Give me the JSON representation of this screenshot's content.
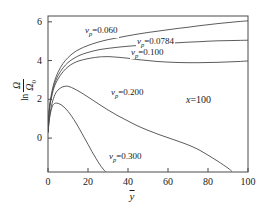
{
  "chart_data": {
    "type": "line",
    "title": "",
    "xlabel": "ȳ",
    "ylabel": "ln Ω/Ω₀",
    "xlim": [
      0,
      100
    ],
    "ylim": [
      -1.75,
      6.3
    ],
    "grid": false,
    "legend_position": "inline-annotations",
    "xticks": [
      "0",
      "20",
      "40",
      "60",
      "80",
      "100"
    ],
    "xtick_values": [
      0,
      20,
      40,
      60,
      80,
      100
    ],
    "yticks": [
      "0",
      "2",
      "4",
      "6"
    ],
    "ytick_values": [
      0,
      2,
      4,
      6
    ],
    "annotations": [
      {
        "text": "x=100",
        "x": 64,
        "y": 3.0
      }
    ],
    "series": [
      {
        "name": "v_p=0.060",
        "label": "v",
        "label_sub": "p",
        "label_value": "=0.060",
        "label_x": 18,
        "label_y": 5.45,
        "x": [
          0,
          0.6,
          1.5,
          3,
          5,
          7.5,
          10,
          13,
          16,
          20,
          25,
          30,
          35,
          40,
          45,
          50,
          55,
          60,
          65,
          70,
          75,
          80,
          85,
          90,
          95,
          100
        ],
        "y": [
          0.3,
          1.45,
          2.15,
          2.85,
          3.4,
          3.85,
          4.15,
          4.42,
          4.6,
          4.78,
          4.95,
          5.08,
          5.18,
          5.28,
          5.37,
          5.45,
          5.52,
          5.59,
          5.66,
          5.72,
          5.79,
          5.85,
          5.91,
          5.96,
          6.01,
          6.05
        ]
      },
      {
        "name": "v_p=0.0784",
        "label": "v",
        "label_sub": "p",
        "label_value": "=0.0784",
        "label_x": 44,
        "label_y": 4.92,
        "x": [
          0,
          0.6,
          1.5,
          3,
          5,
          7.5,
          10,
          13,
          16,
          20,
          25,
          30,
          35,
          40,
          45,
          50,
          55,
          60,
          65,
          70,
          75,
          80,
          85,
          90,
          95,
          100
        ],
        "y": [
          0.3,
          1.4,
          2.05,
          2.72,
          3.22,
          3.62,
          3.9,
          4.12,
          4.28,
          4.42,
          4.55,
          4.63,
          4.69,
          4.74,
          4.78,
          4.82,
          4.86,
          4.89,
          4.92,
          4.95,
          4.97,
          5.0,
          5.02,
          5.03,
          5.04,
          5.05
        ]
      },
      {
        "name": "v_p=0.100",
        "label": "v",
        "label_sub": "p",
        "label_value": "=0.100",
        "label_x": 41,
        "label_y": 4.35,
        "x": [
          0,
          0.6,
          1.5,
          3,
          5,
          7.5,
          10,
          13,
          16,
          20,
          25,
          28,
          31,
          35,
          40,
          45,
          50,
          55,
          60,
          65,
          70,
          75,
          80,
          85,
          90,
          95,
          100
        ],
        "y": [
          0.3,
          1.35,
          1.98,
          2.6,
          3.05,
          3.42,
          3.68,
          3.88,
          4.0,
          4.1,
          4.18,
          4.2,
          4.2,
          4.17,
          4.12,
          4.05,
          4.0,
          3.95,
          3.92,
          3.9,
          3.89,
          3.89,
          3.9,
          3.91,
          3.93,
          3.95,
          3.98
        ]
      },
      {
        "name": "v_p=0.200",
        "label": "v",
        "label_sub": "p",
        "label_value": "=0.200",
        "label_x": 31,
        "label_y": 2.28,
        "x": [
          0,
          0.8,
          2,
          3.5,
          5,
          7,
          9,
          10.5,
          13,
          16,
          20,
          25,
          30,
          35,
          40,
          45,
          50,
          55,
          60,
          65,
          70,
          75,
          80,
          85,
          90,
          92
        ],
        "y": [
          0.3,
          1.1,
          1.78,
          2.25,
          2.48,
          2.63,
          2.68,
          2.66,
          2.55,
          2.38,
          2.12,
          1.78,
          1.45,
          1.15,
          0.88,
          0.62,
          0.4,
          0.2,
          0.02,
          -0.16,
          -0.35,
          -0.58,
          -0.88,
          -1.2,
          -1.55,
          -1.72
        ]
      },
      {
        "name": "v_p=0.300",
        "label": "v",
        "label_sub": "p",
        "label_value": "=0.300",
        "label_x": 30,
        "label_y": -1.05,
        "x": [
          0,
          0.8,
          2,
          3.2,
          4.5,
          6,
          8,
          10,
          12,
          14,
          16,
          18,
          20,
          22,
          24,
          26,
          28,
          28.8
        ],
        "y": [
          0.3,
          1.05,
          1.6,
          1.78,
          1.8,
          1.75,
          1.6,
          1.38,
          1.1,
          0.78,
          0.42,
          0.05,
          -0.32,
          -0.7,
          -1.05,
          -1.38,
          -1.65,
          -1.73
        ]
      }
    ]
  },
  "axes": {
    "x_label_text": "y",
    "y_label_ln": "ln",
    "y_label_num": "Ω",
    "y_label_den": "Ω",
    "y_label_den_sub": "0"
  },
  "annotation_main": {
    "var": "x",
    "value": "=100"
  }
}
